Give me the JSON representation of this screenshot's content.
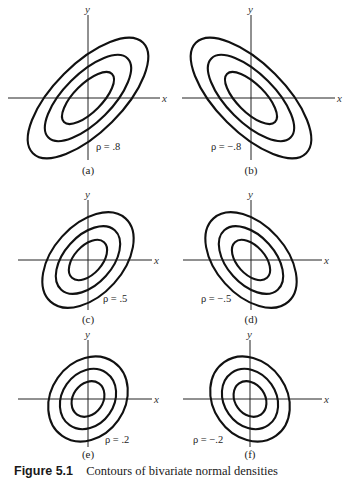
{
  "figure": {
    "caption_label": "Figure 5.1",
    "caption_text": "Contours of bivariate normal densities",
    "axis_x_label": "x",
    "axis_y_label": "y",
    "panels": [
      {
        "id": "a",
        "label": "(a)",
        "rho_text": "ρ = .8",
        "rho": 0.8,
        "cx": 88,
        "cy": 98,
        "xaxis": [
          8,
          160
        ],
        "yaxis": [
          15,
          160
        ],
        "label_y": 174,
        "rho_x": 96,
        "rho_y": 150,
        "ellipses": [
          {
            "rx": 34,
            "ry": 14
          },
          {
            "rx": 56,
            "ry": 24
          },
          {
            "rx": 78,
            "ry": 34
          }
        ],
        "angle": -45
      },
      {
        "id": "b",
        "label": "(b)",
        "rho_text": "ρ = −.8",
        "rho": -0.8,
        "cx": 251,
        "cy": 98,
        "xaxis": [
          182,
          335
        ],
        "yaxis": [
          15,
          160
        ],
        "label_y": 174,
        "rho_x": 211,
        "rho_y": 150,
        "ellipses": [
          {
            "rx": 34,
            "ry": 14
          },
          {
            "rx": 56,
            "ry": 24
          },
          {
            "rx": 78,
            "ry": 34
          }
        ],
        "angle": 45
      },
      {
        "id": "c",
        "label": "(c)",
        "rho_text": "ρ = .5",
        "rho": 0.5,
        "cx": 88,
        "cy": 260,
        "xaxis": [
          18,
          152
        ],
        "yaxis": [
          200,
          310
        ],
        "label_y": 323,
        "rho_x": 103,
        "rho_y": 302,
        "ellipses": [
          {
            "rx": 24,
            "ry": 14
          },
          {
            "rx": 40,
            "ry": 24
          },
          {
            "rx": 56,
            "ry": 35
          }
        ],
        "angle": -48
      },
      {
        "id": "d",
        "label": "(d)",
        "rho_text": "ρ = −.5",
        "rho": -0.5,
        "cx": 251,
        "cy": 260,
        "xaxis": [
          183,
          322
        ],
        "yaxis": [
          200,
          310
        ],
        "label_y": 323,
        "rho_x": 201,
        "rho_y": 302,
        "ellipses": [
          {
            "rx": 24,
            "ry": 14
          },
          {
            "rx": 40,
            "ry": 24
          },
          {
            "rx": 56,
            "ry": 35
          }
        ],
        "angle": 48
      },
      {
        "id": "e",
        "label": "(e)",
        "rho_text": "ρ = .2",
        "rho": 0.2,
        "cx": 88,
        "cy": 399,
        "xaxis": [
          18,
          152
        ],
        "yaxis": [
          340,
          447
        ],
        "label_y": 458,
        "rho_x": 105,
        "rho_y": 443,
        "ellipses": [
          {
            "rx": 19,
            "ry": 15
          },
          {
            "rx": 32,
            "ry": 26
          },
          {
            "rx": 45,
            "ry": 37
          }
        ],
        "angle": -55
      },
      {
        "id": "f",
        "label": "(f)",
        "rho_text": "ρ = −.2",
        "rho": -0.2,
        "cx": 250,
        "cy": 399,
        "xaxis": [
          183,
          322
        ],
        "yaxis": [
          340,
          447
        ],
        "label_y": 458,
        "rho_x": 193,
        "rho_y": 443,
        "ellipses": [
          {
            "rx": 19,
            "ry": 15
          },
          {
            "rx": 32,
            "ry": 26
          },
          {
            "rx": 45,
            "ry": 37
          }
        ],
        "angle": 55
      }
    ]
  }
}
